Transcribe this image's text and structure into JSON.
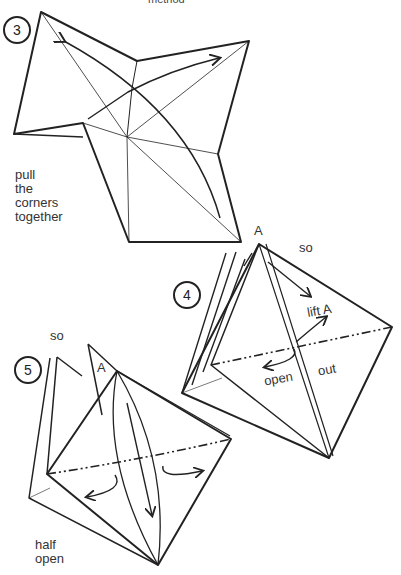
{
  "header": {
    "text": "method"
  },
  "steps": [
    {
      "number": "3",
      "caption": [
        "pull",
        "the",
        "corners",
        "together"
      ]
    },
    {
      "number": "4",
      "labels": {
        "a": "A",
        "so": "so",
        "lift": "lift A",
        "open": "open",
        "out": "out"
      }
    },
    {
      "number": "5",
      "labels": {
        "a": "A",
        "so": "so",
        "caption": [
          "half",
          "open"
        ]
      }
    }
  ]
}
